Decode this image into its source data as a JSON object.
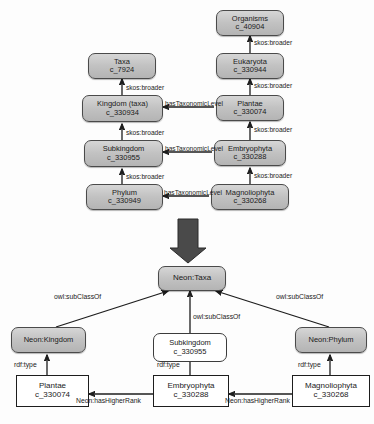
{
  "diagram": {
    "upper": {
      "nodes": [
        {
          "id": "organisms",
          "label": "Organisms",
          "code": "c_40904"
        },
        {
          "id": "eukaryota",
          "label": "Eukaryota",
          "code": "c_330944"
        },
        {
          "id": "plantae",
          "label": "Plantae",
          "code": "c_330074"
        },
        {
          "id": "embryophyta",
          "label": "Embryophyta",
          "code": "c_330288"
        },
        {
          "id": "magnoliophyta",
          "label": "Magnoliophyta",
          "code": "c_330268"
        },
        {
          "id": "taxa",
          "label": "Taxa",
          "code": "c_7924"
        },
        {
          "id": "kingdom",
          "label": "Kingdom (taxa)",
          "code": "c_330934"
        },
        {
          "id": "subkingdom",
          "label": "Subkingdom",
          "code": "c_330955"
        },
        {
          "id": "phylum",
          "label": "Phylum",
          "code": "c_330949"
        }
      ],
      "edge_labels": {
        "skos_broader": "skos:broader",
        "has_taxonomic_level": "hasTaxonomicLevel"
      }
    },
    "lower": {
      "nodes": [
        {
          "id": "neon_taxa",
          "label": "Neon:Taxa",
          "code": ""
        },
        {
          "id": "neon_kingdom",
          "label": "Neon:Kingdom",
          "code": ""
        },
        {
          "id": "neon_phylum",
          "label": "Neon:Phylum",
          "code": ""
        },
        {
          "id": "sub_subkingdom",
          "label": "Subkingdom",
          "code": "c_330955"
        },
        {
          "id": "inst_plantae",
          "label": "Plantae",
          "code": "c_330074"
        },
        {
          "id": "inst_embryophyta",
          "label": "Embryophyta",
          "code": "c_330288"
        },
        {
          "id": "inst_magnoliophyta",
          "label": "Magnoliophyta",
          "code": "c_330268"
        }
      ],
      "edge_labels": {
        "owl_subclassof": "owl:subClassOf",
        "rdf_type": "rdf:type",
        "neon_has_higher_rank": "Neon:hasHigherRank"
      }
    }
  }
}
